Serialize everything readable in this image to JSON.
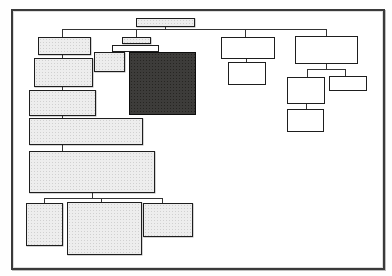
{
  "diagram": {
    "type": "sitemap-tree",
    "colors": {
      "background": "#fefefe",
      "frame_border": "#3a3a3a",
      "frame_fill": "#ffffff",
      "line": "#343434",
      "shaded_fill": "#ededed",
      "shaded_dot": "#d0d0d0",
      "white_fill": "#ffffff",
      "dark_fill": "#3d3c3a",
      "node_border": "#1e1e1e"
    },
    "frame": {
      "x": 11,
      "y": 9,
      "w": 374,
      "h": 261
    },
    "nodes": [
      {
        "id": "root-bar",
        "fill": "shaded",
        "x": 136,
        "y": 18,
        "w": 59,
        "h": 9
      },
      {
        "id": "left-1",
        "fill": "shaded",
        "x": 38,
        "y": 37,
        "w": 53,
        "h": 18
      },
      {
        "id": "left-2",
        "fill": "shaded",
        "x": 34,
        "y": 58,
        "w": 59,
        "h": 29
      },
      {
        "id": "left-3",
        "fill": "shaded",
        "x": 29,
        "y": 90,
        "w": 67,
        "h": 26
      },
      {
        "id": "left-4",
        "fill": "shaded",
        "x": 29,
        "y": 118,
        "w": 114,
        "h": 27
      },
      {
        "id": "left-5",
        "fill": "shaded",
        "x": 29,
        "y": 151,
        "w": 126,
        "h": 42
      },
      {
        "id": "bottom-left",
        "fill": "shaded",
        "x": 26,
        "y": 203,
        "w": 37,
        "h": 43
      },
      {
        "id": "bottom-center",
        "fill": "shaded",
        "x": 67,
        "y": 202,
        "w": 75,
        "h": 53
      },
      {
        "id": "bottom-right",
        "fill": "shaded",
        "x": 143,
        "y": 203,
        "w": 50,
        "h": 34
      },
      {
        "id": "center-bar-1",
        "fill": "shaded",
        "x": 122,
        "y": 37,
        "w": 29,
        "h": 7
      },
      {
        "id": "center-bar-2",
        "fill": "white",
        "x": 112,
        "y": 45,
        "w": 47,
        "h": 7
      },
      {
        "id": "center-small",
        "fill": "shaded",
        "x": 94,
        "y": 52,
        "w": 31,
        "h": 20
      },
      {
        "id": "center-dark",
        "fill": "dark",
        "x": 129,
        "y": 52,
        "w": 67,
        "h": 63
      },
      {
        "id": "right-a",
        "fill": "white",
        "x": 221,
        "y": 37,
        "w": 54,
        "h": 22
      },
      {
        "id": "right-a-child",
        "fill": "white",
        "x": 228,
        "y": 62,
        "w": 38,
        "h": 23
      },
      {
        "id": "right-b",
        "fill": "white",
        "x": 295,
        "y": 36,
        "w": 63,
        "h": 28
      },
      {
        "id": "right-c",
        "fill": "white",
        "x": 287,
        "y": 77,
        "w": 38,
        "h": 27
      },
      {
        "id": "right-d",
        "fill": "white",
        "x": 329,
        "y": 76,
        "w": 38,
        "h": 15
      },
      {
        "id": "right-e",
        "fill": "white",
        "x": 287,
        "y": 109,
        "w": 37,
        "h": 23
      }
    ],
    "connectors": [
      {
        "id": "root-stem",
        "x": 165,
        "y": 27,
        "w": 1,
        "h": 3
      },
      {
        "id": "main-rail",
        "x": 62,
        "y": 29,
        "w": 265,
        "h": 1
      },
      {
        "id": "drop-left-1",
        "x": 62,
        "y": 30,
        "w": 1,
        "h": 7
      },
      {
        "id": "drop-center-bar",
        "x": 136,
        "y": 30,
        "w": 1,
        "h": 7
      },
      {
        "id": "drop-right-a",
        "x": 245,
        "y": 30,
        "w": 1,
        "h": 7
      },
      {
        "id": "drop-right-b",
        "x": 326,
        "y": 30,
        "w": 1,
        "h": 6
      },
      {
        "id": "left-1-to-2",
        "x": 62,
        "y": 55,
        "w": 1,
        "h": 3
      },
      {
        "id": "left-2-to-3",
        "x": 62,
        "y": 87,
        "w": 1,
        "h": 3
      },
      {
        "id": "left-3-to-4",
        "x": 62,
        "y": 116,
        "w": 1,
        "h": 2
      },
      {
        "id": "left-4-to-5",
        "x": 62,
        "y": 145,
        "w": 1,
        "h": 6
      },
      {
        "id": "left-5-stem",
        "x": 92,
        "y": 193,
        "w": 1,
        "h": 5
      },
      {
        "id": "bottom-rail",
        "x": 44,
        "y": 198,
        "w": 119,
        "h": 1
      },
      {
        "id": "drop-bottom-left",
        "x": 44,
        "y": 199,
        "w": 1,
        "h": 4
      },
      {
        "id": "drop-bottom-mid",
        "x": 101,
        "y": 199,
        "w": 1,
        "h": 3
      },
      {
        "id": "drop-bottom-right",
        "x": 162,
        "y": 199,
        "w": 1,
        "h": 4
      },
      {
        "id": "right-a-stem",
        "x": 246,
        "y": 59,
        "w": 1,
        "h": 3
      },
      {
        "id": "right-b-stem",
        "x": 326,
        "y": 64,
        "w": 1,
        "h": 5
      },
      {
        "id": "right-b-rail",
        "x": 307,
        "y": 69,
        "w": 39,
        "h": 1
      },
      {
        "id": "drop-right-c",
        "x": 307,
        "y": 70,
        "w": 1,
        "h": 7
      },
      {
        "id": "drop-right-d",
        "x": 345,
        "y": 70,
        "w": 1,
        "h": 6
      },
      {
        "id": "right-c-to-e",
        "x": 306,
        "y": 104,
        "w": 1,
        "h": 5
      }
    ]
  }
}
